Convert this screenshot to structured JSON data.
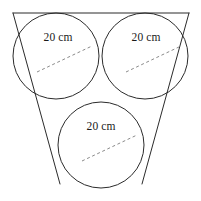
{
  "figure": {
    "canvas": {
      "width": 201,
      "height": 201,
      "background": "#ffffff"
    },
    "stroke_colors": {
      "outline": "#2b2b2b",
      "dashed_radius": "#8a8a8a",
      "label_text": "#1a1a1a"
    },
    "circles": [
      {
        "id": "top-left",
        "name": "top-left-circle",
        "cx": 56,
        "cy": 56,
        "r": 43,
        "label": "20 cm",
        "label_x": 58,
        "label_y": 41,
        "radius_line": {
          "x1": 37,
          "y1": 72,
          "x2": 92,
          "y2": 46
        }
      },
      {
        "id": "top-right",
        "name": "top-right-circle",
        "cx": 145,
        "cy": 56,
        "r": 43,
        "label": "20 cm",
        "label_x": 146,
        "label_y": 41,
        "radius_line": {
          "x1": 126,
          "y1": 72,
          "x2": 181,
          "y2": 46
        }
      },
      {
        "id": "bottom-center",
        "name": "bottom-center-circle",
        "cx": 101,
        "cy": 145,
        "r": 43,
        "label": "20 cm",
        "label_x": 101,
        "label_y": 130,
        "radius_line": {
          "x1": 82,
          "y1": 161,
          "x2": 137,
          "y2": 135
        }
      }
    ],
    "triangle_sides": [
      {
        "id": "top",
        "name": "triangle-side-top",
        "x1": 13,
        "y1": 13,
        "x2": 189,
        "y2": 13
      },
      {
        "id": "left",
        "name": "triangle-side-left",
        "x1": 13,
        "y1": 13,
        "x2": 60,
        "y2": 184
      },
      {
        "id": "right",
        "name": "triangle-side-right",
        "x1": 189,
        "y1": 13,
        "x2": 142,
        "y2": 184
      }
    ],
    "labels": {
      "diameter_text": "20 cm",
      "unit": "cm",
      "value": 20
    }
  }
}
